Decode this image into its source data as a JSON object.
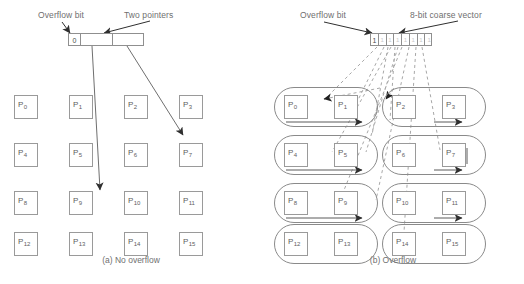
{
  "figure": {
    "panels": [
      {
        "id": "a",
        "caption": "(a) No overflow",
        "label_overflow": "Overflow bit",
        "label_pointers": "Two pointers",
        "header": {
          "overflow_bit_value": "0",
          "cells": [
            "0",
            "",
            ""
          ],
          "cell_kinds": [
            "overflow-bit",
            "pointer-1",
            "pointer-2"
          ]
        },
        "pages": [
          "P0",
          "P1",
          "P2",
          "P3",
          "P4",
          "P5",
          "P6",
          "P7",
          "P8",
          "P9",
          "P10",
          "P11",
          "P12",
          "P13",
          "P14",
          "P15"
        ],
        "page_labels": [
          {
            "base": "P",
            "sub": "0"
          },
          {
            "base": "P",
            "sub": "1"
          },
          {
            "base": "P",
            "sub": "2"
          },
          {
            "base": "P",
            "sub": "3"
          },
          {
            "base": "P",
            "sub": "4"
          },
          {
            "base": "P",
            "sub": "5"
          },
          {
            "base": "P",
            "sub": "6"
          },
          {
            "base": "P",
            "sub": "7"
          },
          {
            "base": "P",
            "sub": "8"
          },
          {
            "base": "P",
            "sub": "9"
          },
          {
            "base": "P",
            "sub": "10"
          },
          {
            "base": "P",
            "sub": "11"
          },
          {
            "base": "P",
            "sub": "12"
          },
          {
            "base": "P",
            "sub": "13"
          },
          {
            "base": "P",
            "sub": "14"
          },
          {
            "base": "P",
            "sub": "15"
          }
        ],
        "pointer_targets": [
          "P9",
          "P7"
        ]
      },
      {
        "id": "b",
        "caption": "(b) Overflow",
        "label_overflow": "Overflow bit",
        "label_vector": "8-bit coarse vector",
        "header": {
          "overflow_bit_value": "1",
          "vector_bits": [
            "1",
            "1",
            "1",
            "1",
            "1",
            "1",
            "1",
            "1"
          ],
          "vector_width_bits": 8
        },
        "pages": [
          "P0",
          "P1",
          "P2",
          "P3",
          "P4",
          "P5",
          "P6",
          "P7",
          "P8",
          "P9",
          "P10",
          "P11",
          "P12",
          "P13",
          "P14",
          "P15"
        ],
        "page_labels": [
          {
            "base": "P",
            "sub": "0"
          },
          {
            "base": "P",
            "sub": "1"
          },
          {
            "base": "P",
            "sub": "2"
          },
          {
            "base": "P",
            "sub": "3"
          },
          {
            "base": "P",
            "sub": "4"
          },
          {
            "base": "P",
            "sub": "5"
          },
          {
            "base": "P",
            "sub": "6"
          },
          {
            "base": "P",
            "sub": "7"
          },
          {
            "base": "P",
            "sub": "8"
          },
          {
            "base": "P",
            "sub": "9"
          },
          {
            "base": "P",
            "sub": "10"
          },
          {
            "base": "P",
            "sub": "11"
          },
          {
            "base": "P",
            "sub": "12"
          },
          {
            "base": "P",
            "sub": "13"
          },
          {
            "base": "P",
            "sub": "14"
          },
          {
            "base": "P",
            "sub": "15"
          }
        ],
        "group_count": 8,
        "pages_per_group": 2
      }
    ],
    "colors": {
      "box_border": "#9a9a9a",
      "pill_border": "#8a8a8a",
      "text": "#6b6b6b",
      "arrow_solid": "#3a3a3a",
      "arrow_dashed": "#9a9a9a",
      "background": "#ffffff"
    }
  }
}
